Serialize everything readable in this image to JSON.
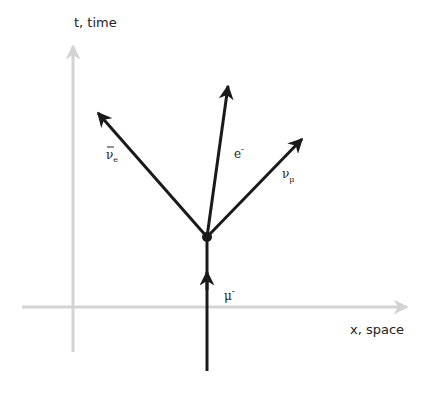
{
  "diagram": {
    "type": "spacetime-diagram",
    "axes": {
      "time_label": "t, time",
      "space_label": "x, space",
      "color": "#d3d3d3"
    },
    "particle_color": "#1a1a1a",
    "particles": [
      {
        "id": "muon",
        "symbol": "μ",
        "superscript": "-",
        "subscript": "",
        "overbar": false,
        "role": "incoming"
      },
      {
        "id": "electron",
        "symbol": "e",
        "superscript": "-",
        "subscript": "",
        "overbar": false,
        "role": "outgoing"
      },
      {
        "id": "muon-neutrino",
        "symbol": "ν",
        "superscript": "",
        "subscript": "μ",
        "overbar": false,
        "role": "outgoing"
      },
      {
        "id": "electron-antineutrino",
        "symbol": "ν",
        "superscript": "",
        "subscript": "e",
        "overbar": true,
        "role": "outgoing"
      }
    ],
    "vertex": "decay-vertex"
  }
}
